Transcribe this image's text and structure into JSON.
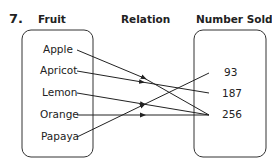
{
  "question_number": "7.",
  "headers": {
    "left": "Fruit",
    "middle": "Relation",
    "right": "Number Sold"
  },
  "domain_items": [
    "Apple",
    "Apricot",
    "Lemon",
    "Orange",
    "Papaya"
  ],
  "range_items": [
    "93",
    "187",
    "256"
  ],
  "mappings": [
    {
      "from": "Apple",
      "to": "256"
    },
    {
      "from": "Apricot",
      "to": "187"
    },
    {
      "from": "Lemon",
      "to": "256"
    },
    {
      "from": "Orange",
      "to": "256"
    },
    {
      "from": "Papaya",
      "to": "93"
    }
  ],
  "colors": {
    "line": "#222222",
    "box": "#333333"
  }
}
